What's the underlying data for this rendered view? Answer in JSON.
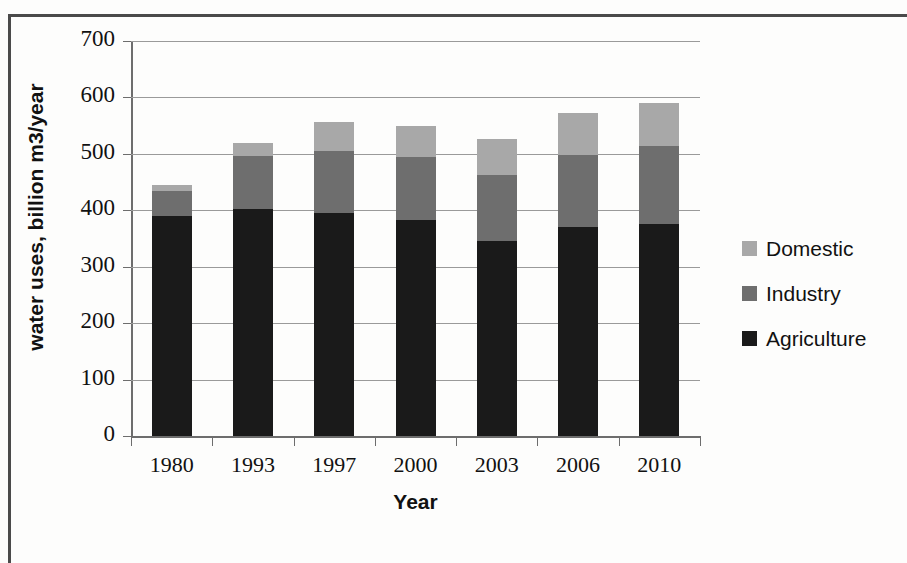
{
  "chart_data": {
    "type": "bar",
    "stacked": true,
    "title": "",
    "xlabel": "Year",
    "ylabel": "water uses, billion m3/year",
    "categories": [
      "1980",
      "1993",
      "1997",
      "2000",
      "2003",
      "2006",
      "2010"
    ],
    "series": [
      {
        "name": "Agriculture",
        "color": "#1a1a1a",
        "values": [
          390,
          403,
          396,
          382,
          345,
          370,
          375
        ]
      },
      {
        "name": "Industry",
        "color": "#6e6e6e",
        "values": [
          45,
          93,
          109,
          112,
          118,
          128,
          139
        ]
      },
      {
        "name": "Domestic",
        "color": "#a8a8a8",
        "values": [
          10,
          24,
          51,
          56,
          64,
          75,
          76
        ]
      }
    ],
    "totals": [
      445,
      520,
      556,
      550,
      527,
      573,
      590
    ],
    "ylim": [
      0,
      700
    ],
    "ytick_labels": [
      "0",
      "100",
      "200",
      "300",
      "400",
      "500",
      "600",
      "700"
    ],
    "ytick_values": [
      0,
      100,
      200,
      300,
      400,
      500,
      600,
      700
    ],
    "ytick_step": 100,
    "grid": "horizontal",
    "legend_position": "right",
    "legend_order": [
      "Domestic",
      "Industry",
      "Agriculture"
    ],
    "background": "#ffffff",
    "gridline_color": "#9a9a9a",
    "axis_color": "#6d6d6d",
    "text_color": "#111111"
  }
}
